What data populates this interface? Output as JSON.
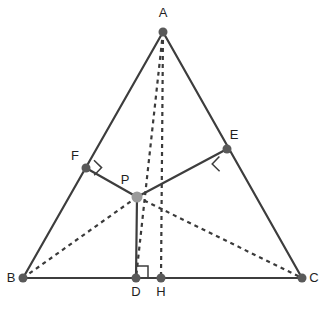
{
  "figure": {
    "background_color": "#ffffff",
    "width": 325,
    "height": 312,
    "stroke_color": "#3d3d3d",
    "dot_color": "#595959",
    "interior_dot_color": "#9a9a9a",
    "label_color": "#1f1f1f"
  },
  "points": {
    "A": {
      "label": "A",
      "x": 163,
      "y": 32,
      "label_x": 163,
      "label_y": 17,
      "dot": "dark",
      "r": 4.5
    },
    "B": {
      "label": "B",
      "x": 23,
      "y": 278,
      "label_x": 11,
      "label_y": 282,
      "dot": "dark",
      "r": 4.5
    },
    "C": {
      "label": "C",
      "x": 302,
      "y": 278,
      "label_x": 314,
      "label_y": 282,
      "dot": "dark",
      "r": 4.5
    },
    "D": {
      "label": "D",
      "x": 136,
      "y": 278,
      "label_x": 136,
      "label_y": 296,
      "dot": "dark",
      "r": 4.5
    },
    "E": {
      "label": "E",
      "x": 227,
      "y": 149,
      "label_x": 234,
      "label_y": 139,
      "dot": "dark",
      "r": 4.5
    },
    "F": {
      "label": "F",
      "x": 86,
      "y": 168,
      "label_x": 75,
      "label_y": 160,
      "dot": "dark",
      "r": 4.5
    },
    "H": {
      "label": "H",
      "x": 161,
      "y": 278,
      "label_x": 161,
      "label_y": 296,
      "dot": "dark",
      "r": 4.5
    },
    "P": {
      "label": "P",
      "x": 137,
      "y": 197,
      "label_x": 125,
      "label_y": 184,
      "dot": "light",
      "r": 5.5
    }
  },
  "segments": [
    {
      "name": "side-AB",
      "from": "A",
      "to": "B",
      "style": "solid"
    },
    {
      "name": "side-AC",
      "from": "A",
      "to": "C",
      "style": "solid"
    },
    {
      "name": "side-BC",
      "from": "B",
      "to": "C",
      "style": "solid"
    },
    {
      "name": "segment-PF",
      "from": "P",
      "to": "F",
      "style": "solid"
    },
    {
      "name": "segment-PE",
      "from": "P",
      "to": "E",
      "style": "solid"
    },
    {
      "name": "segment-PD",
      "from": "P",
      "to": "D",
      "style": "solid"
    },
    {
      "name": "segment-AD",
      "from": "A",
      "to": "D",
      "style": "dashed"
    },
    {
      "name": "segment-AH",
      "from": "A",
      "to": "H",
      "style": "dashed"
    },
    {
      "name": "segment-PB",
      "from": "P",
      "to": "B",
      "style": "dashed"
    },
    {
      "name": "segment-PC",
      "from": "P",
      "to": "C",
      "style": "dashed"
    }
  ],
  "right_angles": [
    {
      "name": "right-angle-at-F",
      "vertex": "F",
      "path": "M 94.0 160.2 L 101.6 167.6 L 94.2 175.2",
      "size": 10.5
    },
    {
      "name": "right-angle-at-E",
      "vertex": "E",
      "path": "M 219.4 156.4 L 212.2 164.0 L 219.6 171.2",
      "size": 10.5
    },
    {
      "name": "right-angle-at-D",
      "vertex": "D",
      "path": "M 136 266 L 148 266 L 148 278",
      "size": 12
    }
  ]
}
